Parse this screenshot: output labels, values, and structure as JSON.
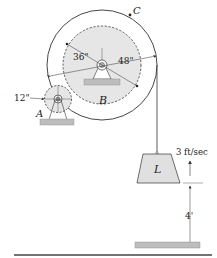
{
  "figure": {
    "labels": {
      "gear_a": "A",
      "gear_b": "B",
      "drum_c": "C",
      "load": "L",
      "radius_a": "12\"",
      "radius_b": "36\"",
      "radius_c": "48\"",
      "velocity": "3 ft/sec",
      "height": "4'"
    },
    "colors": {
      "stroke": "#333333",
      "gear_fill": "#e6e6e6",
      "load_fill": "#e0e0e0",
      "ground_fill": "#bdbdbd",
      "line": "#555555"
    }
  }
}
